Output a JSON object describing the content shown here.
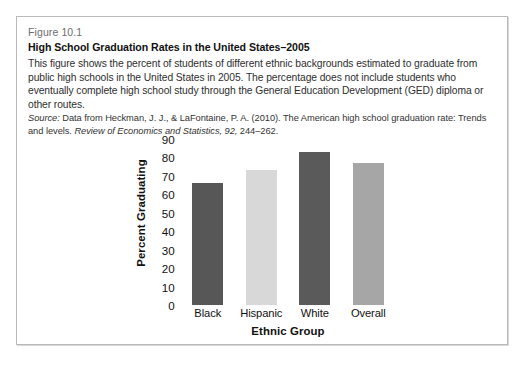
{
  "figure": {
    "number": "Figure 10.1",
    "title": "High School Graduation Rates in the United States–2005",
    "body": "This figure shows the percent of students of different ethnic backgrounds estimated to graduate from public high schools in the United States in 2005. The percentage does not include students who eventually complete high school study through the General Education Development (GED) diploma or other routes.",
    "source_label": "Source:",
    "source_text_1": " Data from Heckman, J. J., & LaFontaine, P. A. (2010). The American high school graduation rate: Trends and levels. ",
    "source_journal": "Review of Economics and Statistics, 92,",
    "source_text_2": " 244–262."
  },
  "chart_data": {
    "type": "bar",
    "title": "High School Graduation Rates in the United States–2005",
    "categories": [
      "Black",
      "Hispanic",
      "White",
      "Overall"
    ],
    "values": [
      66,
      73,
      83,
      77
    ],
    "xlabel": "Ethnic Group",
    "ylabel": "Percent Graduating",
    "ylim": [
      0,
      90
    ],
    "yticks": [
      90,
      80,
      70,
      60,
      50,
      40,
      30,
      20,
      10,
      0
    ],
    "ytick_labels": [
      "90",
      "80",
      "70",
      "60",
      "50",
      "40",
      "30",
      "20",
      "10",
      "0"
    ],
    "grid": false,
    "legend": "none",
    "bar_colors": [
      "#575757",
      "#d8d8d8",
      "#5a5a5a",
      "#a6a6a6"
    ]
  },
  "colors": {
    "border": "#b9b9b9",
    "fig_number": "#6e6e6e",
    "text": "#2e2e2e",
    "title": "#111111"
  }
}
